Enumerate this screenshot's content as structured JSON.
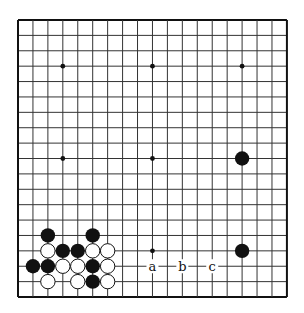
{
  "board": {
    "size": 19,
    "origin": {
      "x": 18,
      "y": 20
    },
    "spacing": {
      "x": 14.94,
      "y": 15.39
    },
    "line_color": "#333333",
    "border_color": "#111111",
    "hoshi": [
      [
        3,
        3
      ],
      [
        9,
        3
      ],
      [
        15,
        3
      ],
      [
        3,
        9
      ],
      [
        9,
        9
      ],
      [
        15,
        9
      ],
      [
        3,
        15
      ],
      [
        9,
        15
      ],
      [
        15,
        15
      ]
    ],
    "stones": [
      {
        "color": "black",
        "col": 15,
        "row": 9
      },
      {
        "color": "black",
        "col": 15,
        "row": 15
      },
      {
        "color": "black",
        "col": 2,
        "row": 14
      },
      {
        "color": "black",
        "col": 5,
        "row": 14
      },
      {
        "color": "white",
        "col": 2,
        "row": 15
      },
      {
        "color": "black",
        "col": 3,
        "row": 15
      },
      {
        "color": "black",
        "col": 4,
        "row": 15
      },
      {
        "color": "white",
        "col": 5,
        "row": 15
      },
      {
        "color": "white",
        "col": 6,
        "row": 15
      },
      {
        "color": "black",
        "col": 1,
        "row": 16
      },
      {
        "color": "black",
        "col": 2,
        "row": 16
      },
      {
        "color": "white",
        "col": 3,
        "row": 16
      },
      {
        "color": "white",
        "col": 4,
        "row": 16
      },
      {
        "color": "black",
        "col": 5,
        "row": 16
      },
      {
        "color": "white",
        "col": 6,
        "row": 16
      },
      {
        "color": "white",
        "col": 2,
        "row": 17
      },
      {
        "color": "white",
        "col": 4,
        "row": 17
      },
      {
        "color": "black",
        "col": 5,
        "row": 17
      },
      {
        "color": "white",
        "col": 6,
        "row": 17
      }
    ],
    "labels": [
      {
        "text": "a",
        "col": 9,
        "row": 16
      },
      {
        "text": "b",
        "col": 11,
        "row": 16
      },
      {
        "text": "c",
        "col": 13,
        "row": 16
      }
    ]
  }
}
